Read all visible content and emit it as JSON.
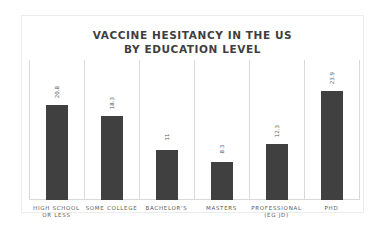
{
  "chart_data": {
    "type": "bar",
    "title": "VACCINE HESITANCY IN THE US BY EDUCATION LEVEL",
    "title_lines": [
      "VACCINE HESITANCY IN THE US",
      "BY EDUCATION LEVEL"
    ],
    "categories": [
      "HIGH SCHOOL OR LESS",
      "SOME COLLEGE",
      "BACHELOR'S",
      "MASTERS",
      "PROFESSIONAL (EG JD)",
      "PHD"
    ],
    "category_lines": [
      [
        "HIGH SCHOOL",
        "OR LESS"
      ],
      [
        "SOME COLLEGE"
      ],
      [
        "BACHELOR'S"
      ],
      [
        "MASTERS"
      ],
      [
        "PROFESSIONAL",
        "(EG JD)"
      ],
      [
        "PHD"
      ]
    ],
    "values": [
      20.8,
      18.3,
      11,
      8.3,
      12.3,
      23.9
    ],
    "value_labels": [
      "20.8",
      "18.3",
      "11",
      "8.3",
      "12.3",
      "23.9"
    ],
    "xlabel": "",
    "ylabel": "",
    "ylim": [
      0,
      28
    ],
    "grid": "vertical",
    "legend": "none",
    "bar_color": "#404040"
  }
}
